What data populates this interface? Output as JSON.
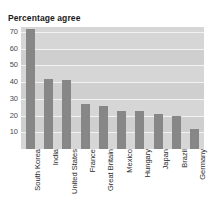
{
  "chart_data": {
    "type": "bar",
    "title": "Percentage agree",
    "xlabel": "",
    "ylabel": "",
    "categories": [
      "South Korea",
      "India",
      "United States",
      "France",
      "Great Britain",
      "Mexico",
      "Hungary",
      "Japan",
      "Brazil",
      "Germany"
    ],
    "values": [
      72,
      42,
      41,
      27,
      26,
      23,
      23,
      21,
      20,
      12
    ],
    "ylim": [
      0,
      73
    ],
    "yticks": [
      10,
      20,
      30,
      40,
      50,
      60,
      70
    ],
    "ytick_labels": [
      "10",
      "20",
      "30",
      "40",
      "50",
      "60",
      "70"
    ],
    "grid": true,
    "legend": false,
    "legend_position": "none",
    "bar_color": "#878787",
    "plot_background": "#d6d6d6",
    "gridline_color": "#f2f2f2",
    "title_color": "#1a1a1a",
    "axis_text_color": "#4a4a4a"
  }
}
